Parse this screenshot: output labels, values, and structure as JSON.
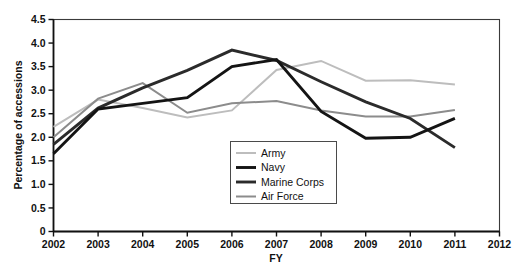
{
  "chart_data": {
    "type": "line",
    "title": "",
    "xlabel": "FY",
    "ylabel": "Percentage of accessions",
    "x": [
      2002,
      2003,
      2004,
      2005,
      2006,
      2007,
      2008,
      2009,
      2010,
      2011
    ],
    "xlim": [
      2002,
      2012
    ],
    "ylim": [
      0,
      4.5
    ],
    "xticks": [
      2002,
      2003,
      2004,
      2005,
      2006,
      2007,
      2008,
      2009,
      2010,
      2011,
      2012
    ],
    "xtick_labels": [
      "2002",
      "2003",
      "2004",
      "2005",
      "2006",
      "2007",
      "2008",
      "2009",
      "2010",
      "2011",
      "2012"
    ],
    "yticks": [
      0,
      0.5,
      1.0,
      1.5,
      2.0,
      2.5,
      3.0,
      3.5,
      4.0,
      4.5
    ],
    "ytick_labels": [
      "0",
      "0.5",
      "1.0",
      "1.5",
      "2.0",
      "2.5",
      "3.0",
      "3.5",
      "4.0",
      "4.5"
    ],
    "grid": false,
    "legend_position": "center",
    "series": [
      {
        "name": "Army",
        "color": "#bdbdbd",
        "width": 2.0,
        "values": [
          2.22,
          2.8,
          2.62,
          2.42,
          2.57,
          3.43,
          3.62,
          3.2,
          3.21,
          3.12
        ]
      },
      {
        "name": "Navy",
        "color": "#141414",
        "width": 2.9,
        "values": [
          1.65,
          2.6,
          2.72,
          2.84,
          3.5,
          3.65,
          2.55,
          1.98,
          2.0,
          2.4
        ]
      },
      {
        "name": "Marine Corps",
        "color": "#2b2b2b",
        "width": 2.9,
        "values": [
          1.85,
          2.62,
          3.05,
          3.42,
          3.85,
          3.63,
          3.18,
          2.75,
          2.4,
          1.78
        ]
      },
      {
        "name": "Air Force",
        "color": "#8c8c8c",
        "width": 2.0,
        "values": [
          2.0,
          2.82,
          3.15,
          2.52,
          2.72,
          2.77,
          2.57,
          2.44,
          2.44,
          2.58
        ]
      }
    ]
  },
  "legend": {
    "entries": [
      {
        "label": "Army"
      },
      {
        "label": "Navy"
      },
      {
        "label": "Marine Corps"
      },
      {
        "label": "Air Force"
      }
    ]
  },
  "axes": {
    "y_title": "Percentage of accessions",
    "x_title": "FY"
  }
}
